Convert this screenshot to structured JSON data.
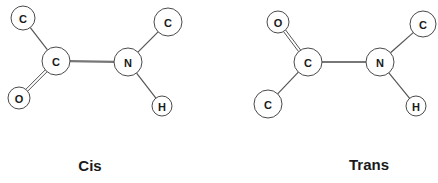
{
  "diagram": {
    "isomers": [
      {
        "name": "Cis",
        "label": "Cis",
        "label_pos": [
          90,
          171
        ],
        "atoms": [
          {
            "id": "c_methyl",
            "symbol": "C",
            "x": 23,
            "y": 18,
            "r": 12
          },
          {
            "id": "c_carbonyl",
            "symbol": "C",
            "x": 56,
            "y": 61,
            "r": 14
          },
          {
            "id": "o",
            "symbol": "O",
            "x": 19,
            "y": 98,
            "r": 11
          },
          {
            "id": "n",
            "symbol": "N",
            "x": 128,
            "y": 62,
            "r": 14
          },
          {
            "id": "c_n_methyl",
            "symbol": "C",
            "x": 168,
            "y": 22,
            "r": 14
          },
          {
            "id": "h",
            "symbol": "H",
            "x": 162,
            "y": 106,
            "r": 10
          }
        ],
        "bonds": [
          {
            "from": "c_methyl",
            "to": "c_carbonyl",
            "type": "single"
          },
          {
            "from": "c_carbonyl",
            "to": "o",
            "type": "double"
          },
          {
            "from": "c_carbonyl",
            "to": "n",
            "type": "peptide"
          },
          {
            "from": "n",
            "to": "c_n_methyl",
            "type": "single"
          },
          {
            "from": "n",
            "to": "h",
            "type": "single"
          }
        ]
      },
      {
        "name": "Trans",
        "label": "Trans",
        "label_pos": [
          369,
          170
        ],
        "atoms": [
          {
            "id": "o",
            "symbol": "O",
            "x": 278,
            "y": 22,
            "r": 11
          },
          {
            "id": "c_carbonyl",
            "symbol": "C",
            "x": 308,
            "y": 62,
            "r": 14
          },
          {
            "id": "c_methyl",
            "symbol": "C",
            "x": 268,
            "y": 104,
            "r": 14
          },
          {
            "id": "n",
            "symbol": "N",
            "x": 380,
            "y": 62,
            "r": 14
          },
          {
            "id": "c_n_methyl",
            "symbol": "C",
            "x": 423,
            "y": 24,
            "r": 13
          },
          {
            "id": "h",
            "symbol": "H",
            "x": 416,
            "y": 106,
            "r": 10
          }
        ],
        "bonds": [
          {
            "from": "o",
            "to": "c_carbonyl",
            "type": "double"
          },
          {
            "from": "c_carbonyl",
            "to": "c_methyl",
            "type": "single"
          },
          {
            "from": "c_carbonyl",
            "to": "n",
            "type": "peptide"
          },
          {
            "from": "n",
            "to": "c_n_methyl",
            "type": "single"
          },
          {
            "from": "n",
            "to": "h",
            "type": "single"
          }
        ]
      }
    ]
  }
}
